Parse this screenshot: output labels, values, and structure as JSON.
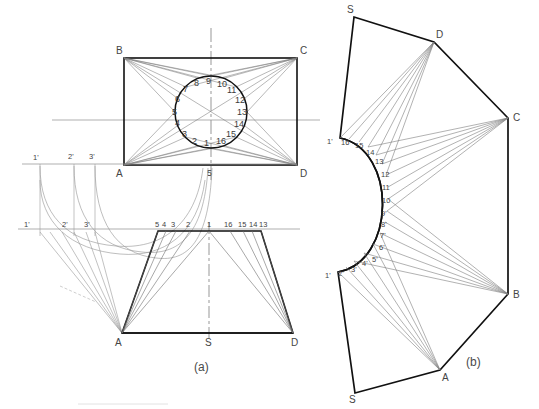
{
  "figure": {
    "caption_a": "(a)",
    "caption_b": "(b)",
    "title_a": "Orthographic views of transition piece",
    "title_b": "Development of transition piece"
  },
  "view_top": {
    "corners": [
      {
        "id": "B",
        "label": "B",
        "x": 124,
        "y": 58
      },
      {
        "id": "C",
        "label": "C",
        "x": 297,
        "y": 58
      },
      {
        "id": "A",
        "label": "A",
        "x": 124,
        "y": 165
      },
      {
        "id": "D",
        "label": "D",
        "x": 297,
        "y": 165
      }
    ],
    "circle": {
      "cx": 211,
      "cy": 112,
      "r": 36,
      "divisions": 16,
      "point_labels": [
        "1",
        "2",
        "3",
        "4",
        "5",
        "6",
        "7",
        "8",
        "9",
        "10",
        "11",
        "12",
        "13",
        "14",
        "15",
        "16"
      ]
    },
    "center_label": "5"
  },
  "view_front": {
    "corners": [
      {
        "id": "A",
        "label": "A",
        "x": 122,
        "y": 333
      },
      {
        "id": "S",
        "label": "S",
        "x": 209,
        "y": 333
      },
      {
        "id": "D",
        "label": "D",
        "x": 293,
        "y": 333
      }
    ],
    "top_edge_labels": [
      "5",
      "4",
      "3",
      "2",
      "1",
      "16",
      "15",
      "14",
      "13"
    ],
    "top_left_x": 158,
    "top_right_x": 261,
    "top_y": 231
  },
  "aux_construction": {
    "upper_line_y": 164,
    "lower_line_y": 229,
    "upper_labels": [
      "1'",
      "2'",
      "3'"
    ],
    "lower_labels": [
      "1'",
      "2'",
      "3'"
    ],
    "upper_label_x": [
      36,
      71,
      92
    ],
    "lower_label_x": [
      25,
      64,
      86
    ]
  },
  "development": {
    "corners": [
      {
        "id": "S_top",
        "label": "S",
        "x": 354,
        "y": 17
      },
      {
        "id": "D",
        "label": "D",
        "x": 434,
        "y": 42
      },
      {
        "id": "C",
        "label": "C",
        "x": 508,
        "y": 118
      },
      {
        "id": "B",
        "label": "B",
        "x": 508,
        "y": 294
      },
      {
        "id": "A",
        "label": "A",
        "x": 440,
        "y": 370
      },
      {
        "id": "S_bot",
        "label": "S",
        "x": 355,
        "y": 393
      }
    ],
    "curve_upper_labels": [
      "1'",
      "16",
      "15",
      "14",
      "13",
      "12",
      "11",
      "10",
      "9'"
    ],
    "curve_lower_labels": [
      "1'",
      "2'",
      "3'",
      "4'",
      "5'",
      "6'",
      "7'",
      "8'",
      "9'"
    ],
    "arc_top": {
      "x": 340,
      "y": 138
    },
    "arc_bottom": {
      "x": 338,
      "y": 272
    },
    "arc_apex": {
      "x": 387,
      "y": 205
    }
  },
  "colors": {
    "outline": "#1a1a1a",
    "construction": "#8a8a8a",
    "thin": "#6e6e6e",
    "centerline": "#5a5a5a",
    "text": "#3a3a3a",
    "background": "#ffffff"
  }
}
